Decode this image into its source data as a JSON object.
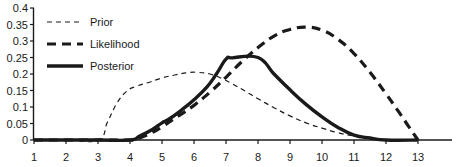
{
  "chart_data": {
    "type": "line",
    "title": "",
    "subtitle": "",
    "xlabel": "",
    "ylabel": "",
    "xlim": [
      1,
      13.6
    ],
    "ylim": [
      0,
      0.4
    ],
    "grid": false,
    "legend_position": "top-left",
    "x_ticks": [
      1,
      2,
      3,
      4,
      5,
      6,
      7,
      8,
      9,
      10,
      11,
      12,
      13
    ],
    "x_tick_labels": [
      "1",
      "2",
      "3",
      "4",
      "5",
      "6",
      "7",
      "8",
      "9",
      "10",
      "11",
      "12",
      "13"
    ],
    "y_ticks": [
      0,
      0.05,
      0.1,
      0.15,
      0.2,
      0.25,
      0.3,
      0.35,
      0.4
    ],
    "y_tick_labels": [
      "0",
      "0.05",
      "0.1",
      "0.15",
      "0.2",
      "0.25",
      "0.3",
      "0.35",
      "0.4"
    ],
    "series": [
      {
        "name": "Prior",
        "style": "thin-dashed",
        "color": "#1a1a1a",
        "width": 1.2,
        "dash": "5,4",
        "points": [
          [
            1.0,
            0.0
          ],
          [
            2.0,
            0.0
          ],
          [
            3.0,
            0.0
          ],
          [
            3.3,
            0.055
          ],
          [
            3.6,
            0.113
          ],
          [
            3.9,
            0.148
          ],
          [
            4.2,
            0.163
          ],
          [
            4.6,
            0.175
          ],
          [
            5.0,
            0.188
          ],
          [
            5.4,
            0.197
          ],
          [
            5.8,
            0.204
          ],
          [
            6.1,
            0.205
          ],
          [
            6.5,
            0.2
          ],
          [
            6.9,
            0.185
          ],
          [
            7.2,
            0.17
          ],
          [
            7.6,
            0.148
          ],
          [
            8.0,
            0.125
          ],
          [
            8.5,
            0.098
          ],
          [
            9.0,
            0.073
          ],
          [
            9.5,
            0.052
          ],
          [
            10.0,
            0.036
          ],
          [
            10.5,
            0.022
          ],
          [
            11.0,
            0.012
          ],
          [
            11.5,
            0.005
          ],
          [
            12.0,
            0.0
          ],
          [
            13.0,
            0.0
          ]
        ]
      },
      {
        "name": "Likelihood",
        "style": "thick-dashed",
        "color": "#1a1a1a",
        "width": 3.2,
        "dash": "9,6",
        "points": [
          [
            1.0,
            0.0
          ],
          [
            2.0,
            0.0
          ],
          [
            3.0,
            0.0
          ],
          [
            4.0,
            0.0
          ],
          [
            4.3,
            0.006
          ],
          [
            4.7,
            0.023
          ],
          [
            5.0,
            0.04
          ],
          [
            5.5,
            0.072
          ],
          [
            6.0,
            0.105
          ],
          [
            6.5,
            0.145
          ],
          [
            7.0,
            0.19
          ],
          [
            7.5,
            0.238
          ],
          [
            8.0,
            0.28
          ],
          [
            8.5,
            0.315
          ],
          [
            9.0,
            0.335
          ],
          [
            9.5,
            0.342
          ],
          [
            10.0,
            0.333
          ],
          [
            10.5,
            0.305
          ],
          [
            11.0,
            0.262
          ],
          [
            11.5,
            0.205
          ],
          [
            12.0,
            0.14
          ],
          [
            12.4,
            0.085
          ],
          [
            12.7,
            0.042
          ],
          [
            13.0,
            0.0
          ]
        ]
      },
      {
        "name": "Posterior",
        "style": "thick-solid",
        "color": "#1a1a1a",
        "width": 3.4,
        "dash": "",
        "points": [
          [
            1.0,
            0.0
          ],
          [
            2.0,
            0.0
          ],
          [
            3.0,
            0.0
          ],
          [
            4.0,
            0.0
          ],
          [
            4.3,
            0.012
          ],
          [
            4.7,
            0.032
          ],
          [
            5.0,
            0.052
          ],
          [
            5.2,
            0.062
          ],
          [
            5.6,
            0.09
          ],
          [
            6.0,
            0.122
          ],
          [
            6.4,
            0.16
          ],
          [
            6.7,
            0.2
          ],
          [
            7.0,
            0.245
          ],
          [
            7.2,
            0.249
          ],
          [
            8.0,
            0.25
          ],
          [
            8.5,
            0.2
          ],
          [
            9.0,
            0.152
          ],
          [
            9.5,
            0.108
          ],
          [
            10.0,
            0.07
          ],
          [
            10.5,
            0.038
          ],
          [
            11.0,
            0.015
          ],
          [
            11.5,
            0.006
          ],
          [
            12.0,
            0.0
          ],
          [
            13.0,
            0.0
          ]
        ]
      }
    ]
  },
  "legend": {
    "items": [
      {
        "label": "Prior"
      },
      {
        "label": "Likelihood"
      },
      {
        "label": "Posterior"
      }
    ]
  },
  "colors": {
    "axis": "#1a1a1a",
    "text": "#1a1a1a",
    "background": "#ffffff"
  }
}
